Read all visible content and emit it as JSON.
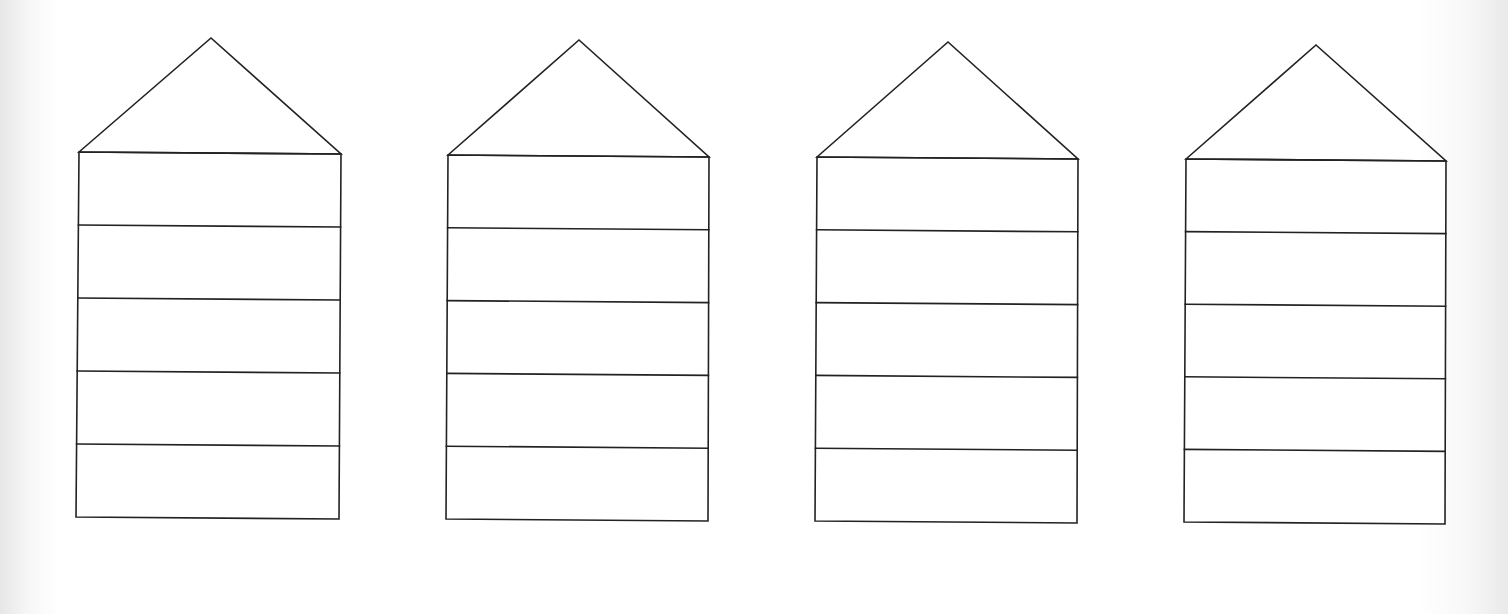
{
  "colors": {
    "background": "#ffffff",
    "line": "#222222",
    "edge_shade": "#e6e6e6"
  },
  "diagram": {
    "rows_per_house": 5,
    "houses": [
      {
        "id": "house-1",
        "roof_apex": [
          211,
          38
        ],
        "body": {
          "top_left": [
            79,
            152
          ],
          "top_right": [
            341,
            154
          ],
          "bottom_left": [
            76,
            517
          ],
          "bottom_right": [
            339,
            519
          ]
        }
      },
      {
        "id": "house-2",
        "roof_apex": [
          579,
          40
        ],
        "body": {
          "top_left": [
            448,
            155
          ],
          "top_right": [
            709,
            157
          ],
          "bottom_left": [
            446,
            519
          ],
          "bottom_right": [
            708,
            521
          ]
        }
      },
      {
        "id": "house-3",
        "roof_apex": [
          948,
          42
        ],
        "body": {
          "top_left": [
            817,
            157
          ],
          "top_right": [
            1078,
            159
          ],
          "bottom_left": [
            815,
            521
          ],
          "bottom_right": [
            1077,
            523
          ]
        }
      },
      {
        "id": "house-4",
        "roof_apex": [
          1316,
          45
        ],
        "body": {
          "top_left": [
            1186,
            159
          ],
          "top_right": [
            1446,
            161
          ],
          "bottom_left": [
            1184,
            522
          ],
          "bottom_right": [
            1445,
            524
          ]
        }
      }
    ]
  }
}
